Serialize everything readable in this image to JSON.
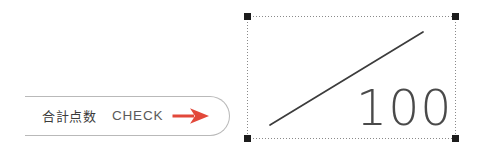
{
  "canvas": {
    "width": 481,
    "height": 162,
    "background_color": "#ffffff"
  },
  "check_badge": {
    "shape": "open-ended-pill-outline",
    "border_color": "#b9b9b9",
    "label_jp": "合計点数",
    "label_jp_color": "#3b3b3b",
    "label_check": "CHECK",
    "label_check_color": "#5a5a5a",
    "arrow_icon": "arrow-right-icon",
    "arrow_color": "#e2483a"
  },
  "selected_object": {
    "selection_border_color": "#8a8a8a",
    "selection_border_style": "dotted",
    "handle_color": "#1c1c1c",
    "handle_count": 4,
    "handles": [
      "top-left",
      "top-right",
      "bottom-left",
      "bottom-right"
    ],
    "diagonal_line_color": "#3c3c3c",
    "score_value": "100",
    "score_color": "#4a4a4a"
  }
}
